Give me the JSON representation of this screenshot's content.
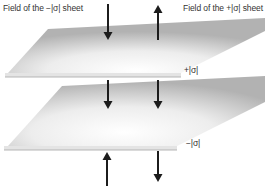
{
  "figure": {
    "labels": {
      "left_field": "Field of the −|σ| sheet",
      "right_field": "Field of the +|σ| sheet",
      "top_sheet_charge": "+|σ|",
      "bottom_sheet_charge": "−|σ|"
    },
    "colors": {
      "background": "#ffffff",
      "arrow": "#1c1c1c",
      "text": "#333333",
      "sheet_face_light": "#ffffff",
      "sheet_face_mid": "#ededed",
      "sheet_face_dark": "#b2b2b2",
      "sheet_edge_fill": "#e4e4e4",
      "sheet_edge_line": "#b5b5b5"
    },
    "sheets": [
      {
        "name": "top-sheet",
        "charge_label": "+|σ|"
      },
      {
        "name": "bottom-sheet",
        "charge_label": "−|σ|"
      }
    ],
    "arrows": [
      {
        "name": "field-arrow-above-sheets-left",
        "direction": "down",
        "x": 108,
        "y_tail": 4,
        "y_tip": 40
      },
      {
        "name": "field-arrow-above-sheets-right",
        "direction": "up",
        "x": 158,
        "y_tail": 40,
        "y_tip": 5
      },
      {
        "name": "field-arrow-between-sheets-left",
        "direction": "down",
        "x": 108,
        "y_tail": 80,
        "y_tip": 109
      },
      {
        "name": "field-arrow-between-sheets-right",
        "direction": "down",
        "x": 158,
        "y_tail": 80,
        "y_tip": 109
      },
      {
        "name": "field-arrow-below-sheets-left",
        "direction": "up",
        "x": 107,
        "y_tail": 186,
        "y_tip": 152
      },
      {
        "name": "field-arrow-below-sheets-right",
        "direction": "down",
        "x": 158,
        "y_tail": 151,
        "y_tip": 182
      }
    ]
  }
}
